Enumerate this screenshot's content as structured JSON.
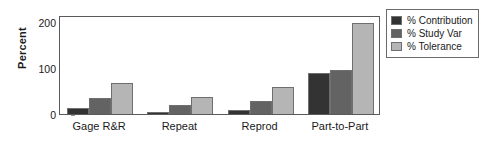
{
  "chart_data": {
    "type": "bar",
    "title": "",
    "subtitle": "",
    "xlabel": "",
    "ylabel": "Percent",
    "ylim": [
      0,
      215
    ],
    "yticks": [
      0,
      100,
      200
    ],
    "ytick_labels": [
      "0",
      "100",
      "200"
    ],
    "grid": false,
    "legend_position": "right",
    "categories": [
      "Gage R&R",
      "Repeat",
      "Reprod",
      "Part-to-Part"
    ],
    "series": [
      {
        "name": "% Contribution",
        "color": "#333333",
        "values": [
          12,
          4,
          9,
          90
        ]
      },
      {
        "name": "% Study Var",
        "color": "#636363",
        "values": [
          35,
          20,
          28,
          96
        ]
      },
      {
        "name": "% Tolerance",
        "color": "#b5b5b5",
        "values": [
          68,
          38,
          58,
          198
        ]
      }
    ]
  },
  "legend": {
    "items": [
      {
        "label": "% Contribution",
        "color": "#333333"
      },
      {
        "label": "% Study Var",
        "color": "#636363"
      },
      {
        "label": "% Tolerance",
        "color": "#b5b5b5"
      }
    ]
  }
}
